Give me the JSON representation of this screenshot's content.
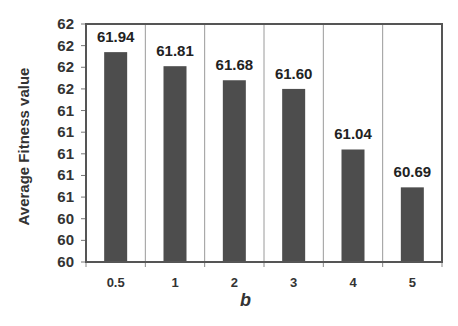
{
  "chart_data": {
    "type": "bar",
    "title": "",
    "xlabel": "b",
    "ylabel": "Average Fitness value",
    "categories": [
      "0.5",
      "1",
      "2",
      "3",
      "4",
      "5"
    ],
    "values": [
      61.94,
      61.81,
      61.68,
      61.6,
      61.04,
      60.69
    ],
    "data_labels": [
      "61.94",
      "61.81",
      "61.68",
      "61.60",
      "61.04",
      "60.69"
    ],
    "ylim": [
      60.0,
      62.2
    ],
    "y_ticks": [
      60.0,
      60.2,
      60.4,
      60.6,
      60.8,
      61.0,
      61.2,
      61.4,
      61.6,
      61.8,
      62.0,
      62.2
    ],
    "y_tick_labels": [
      "60",
      "60",
      "60",
      "61",
      "61",
      "61",
      "61",
      "61",
      "62",
      "62",
      "62",
      "62"
    ],
    "grid": "vertical category separators",
    "legend": "none",
    "bar_color": "#4d4d4d"
  }
}
